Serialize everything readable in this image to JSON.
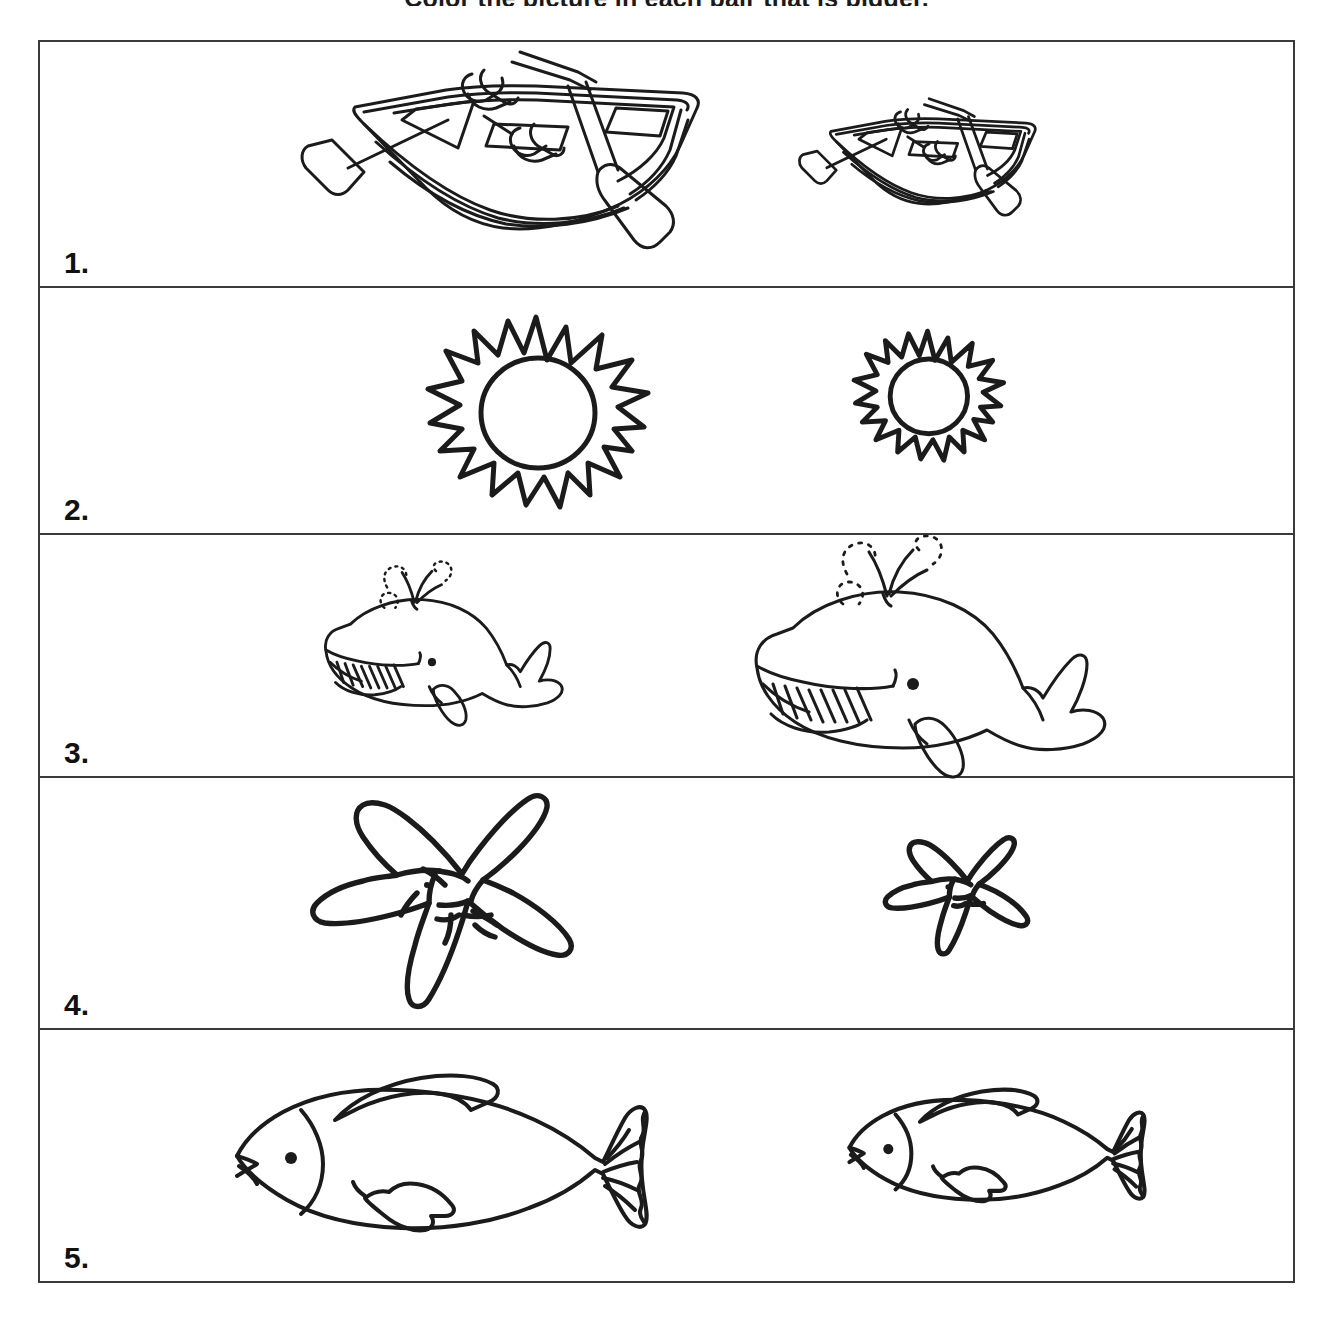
{
  "worksheet": {
    "title": "Color the picture in each pair that is bigger.",
    "border_color": "#3a3a3a",
    "ink_color": "#1b1b1b",
    "background_color": "#ffffff",
    "rows": [
      {
        "number": "1.",
        "subject": "rowboat",
        "left_item": {
          "label": "boat-large",
          "size": "big",
          "scale": 1.0
        },
        "right_item": {
          "label": "boat-small",
          "size": "small",
          "scale": 0.58
        }
      },
      {
        "number": "2.",
        "subject": "sun",
        "left_item": {
          "label": "sun-large",
          "size": "big",
          "scale": 1.0
        },
        "right_item": {
          "label": "sun-small",
          "size": "small",
          "scale": 0.65
        }
      },
      {
        "number": "3.",
        "subject": "whale",
        "left_item": {
          "label": "whale-small",
          "size": "small",
          "scale": 0.68
        },
        "right_item": {
          "label": "whale-large",
          "size": "big",
          "scale": 1.0
        }
      },
      {
        "number": "4.",
        "subject": "starfish",
        "left_item": {
          "label": "starfish-large",
          "size": "big",
          "scale": 1.0
        },
        "right_item": {
          "label": "starfish-small",
          "size": "small",
          "scale": 0.55
        }
      },
      {
        "number": "5.",
        "subject": "fish",
        "left_item": {
          "label": "fish-large",
          "size": "big",
          "scale": 1.0
        },
        "right_item": {
          "label": "fish-small",
          "size": "small",
          "scale": 0.72
        }
      }
    ]
  }
}
